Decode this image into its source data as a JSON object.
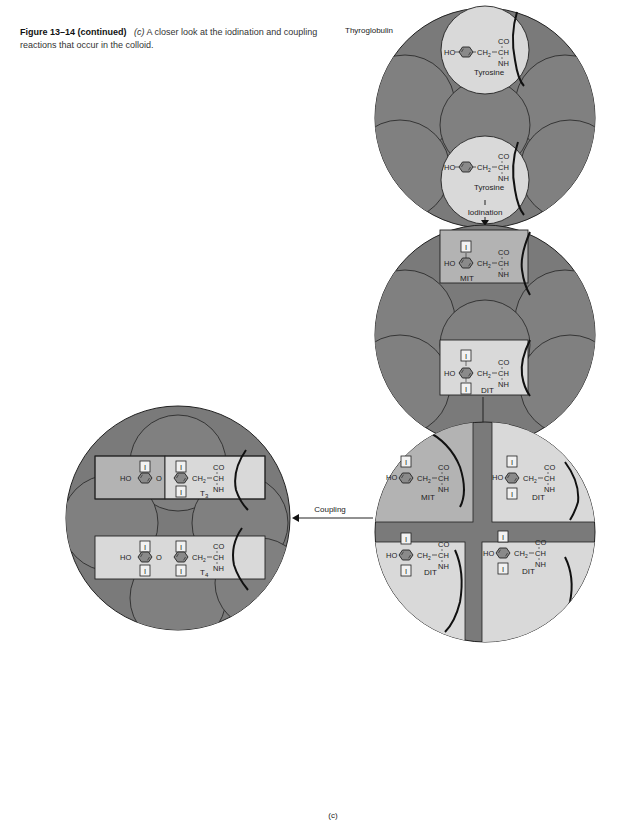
{
  "caption": {
    "figure": "Figure 13–14 (continued)",
    "sublabel": "(c)",
    "text": "A closer look at the iodination and coupling reactions that occur in the colloid."
  },
  "labels": {
    "thyroglobulin": "Thyroglobulin",
    "iodination": "Iodination",
    "coupling": "Coupling",
    "panel": "(c)"
  },
  "molecules": {
    "tyrosine": "Tyrosine",
    "mit": "MIT",
    "dit": "DIT",
    "t3": "T",
    "t3_sub": "3",
    "t4": "T",
    "t4_sub": "4",
    "ho": "HO",
    "ch2": "CH",
    "ch2_sub": "2",
    "co": "CO",
    "ch": "CH",
    "nh": "NH",
    "iodine": "I",
    "o": "O"
  },
  "colors": {
    "colloid_dark": "#7a7a7a",
    "colloid_mid": "#8c8c8c",
    "panel_light": "#d9d9d9",
    "panel_mid": "#b3b3b3",
    "ring_fill": "#8a8a8a",
    "outline": "#222222"
  }
}
